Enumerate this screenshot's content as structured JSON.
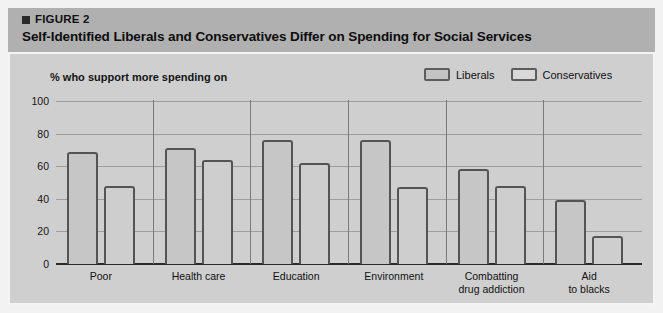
{
  "figure": {
    "marker_icon": "square-bullet-icon",
    "label": "FIGURE 2",
    "title": "Self-Identified Liberals and Conservatives Differ on Spending for Social Services"
  },
  "subtitle": "% who support more spending on",
  "legend": {
    "position": "top-right",
    "items": [
      {
        "label": "Liberals",
        "color": "#c6c6c6"
      },
      {
        "label": "Conservatives",
        "color": "#d8d8d8"
      }
    ]
  },
  "colors": {
    "header_band": "#b0b0b0",
    "panel_background": "#cfcfcf",
    "bar_outline": "#545454",
    "liberals_fill": "#c6c6c6",
    "conservatives_fill": "#cecece",
    "gridline": "#9d9d9d",
    "axis": "#2a2a2a"
  },
  "chart_data": {
    "type": "bar",
    "title": "Self-Identified Liberals and Conservatives Differ on Spending for Social Services",
    "subtitle": "% who support more spending on",
    "xlabel": "",
    "ylabel": "",
    "ylim": [
      0,
      100
    ],
    "yticks": [
      0,
      20,
      40,
      60,
      80,
      100
    ],
    "ytick_labels": [
      "0",
      "20",
      "40",
      "60",
      "80",
      "100"
    ],
    "grid": true,
    "legend_position": "top-right",
    "categories": [
      "Poor",
      "Health care",
      "Education",
      "Environment",
      "Combatting drug addiction",
      "Aid to blacks"
    ],
    "category_lines": [
      [
        "Poor"
      ],
      [
        "Health care"
      ],
      [
        "Education"
      ],
      [
        "Environment"
      ],
      [
        "Combatting",
        "drug addiction"
      ],
      [
        "Aid",
        "to blacks"
      ]
    ],
    "series": [
      {
        "name": "Liberals",
        "values": [
          69,
          71,
          76,
          76,
          58,
          39
        ]
      },
      {
        "name": "Conservatives",
        "values": [
          48,
          64,
          62,
          47,
          48,
          17
        ]
      }
    ]
  }
}
